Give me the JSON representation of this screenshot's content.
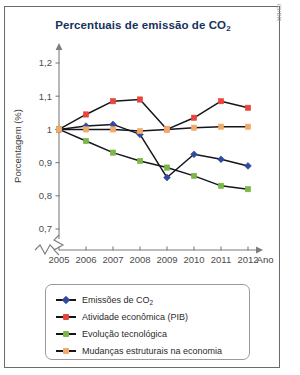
{
  "figure": {
    "title": "Percentuais de emissão de CO",
    "title_sub": "2",
    "credit": "ID/BR"
  },
  "chart_data": {
    "type": "line",
    "title": "Percentuais de emissão de CO2",
    "xlabel": "Ano",
    "ylabel": "Porcentagem (%)",
    "categories": [
      2005,
      2006,
      2007,
      2008,
      2009,
      2010,
      2011,
      2012
    ],
    "x_tick_labels": [
      "2005",
      "2006",
      "2007",
      "2008",
      "2009",
      "2010",
      "2011",
      "2012"
    ],
    "y_tick_labels": [
      "0,7",
      "0,8",
      "0,9",
      "1",
      "1,1",
      "1,2"
    ],
    "y_tick_values": [
      0.7,
      0.8,
      0.9,
      1.0,
      1.1,
      1.2
    ],
    "ylim": [
      0.7,
      1.25
    ],
    "axis_break_y": true,
    "axis_break_x": true,
    "grid": false,
    "legend_position": "below",
    "series": [
      {
        "name": "Emissões de CO2",
        "legend_label": "Emissões de CO",
        "legend_sub": "2",
        "color": "#2f4a9e",
        "marker": "diamond",
        "values": [
          1.0,
          1.01,
          1.015,
          0.985,
          0.855,
          0.925,
          0.91,
          0.89
        ]
      },
      {
        "name": "Atividade econômica (PIB)",
        "legend_label": "Atividade econômica (PIB)",
        "legend_sub": "",
        "color": "#e8453c",
        "marker": "square",
        "values": [
          1.0,
          1.045,
          1.085,
          1.09,
          1.0,
          1.035,
          1.085,
          1.065
        ]
      },
      {
        "name": "Evolução tecnológica",
        "legend_label": "Evolução tecnológica",
        "legend_sub": "",
        "color": "#7ab648",
        "marker": "square",
        "values": [
          1.0,
          0.965,
          0.93,
          0.905,
          0.885,
          0.86,
          0.83,
          0.82
        ]
      },
      {
        "name": "Mudanças estruturais na economia",
        "legend_label": "Mudanças estruturais na economia",
        "legend_sub": "",
        "color": "#f2aa6b",
        "marker": "square",
        "values": [
          1.0,
          1.0,
          1.0,
          0.995,
          1.0,
          1.005,
          1.008,
          1.008
        ]
      }
    ]
  }
}
